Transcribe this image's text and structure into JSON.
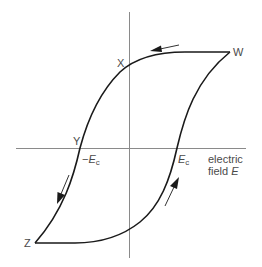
{
  "diagram": {
    "type": "ferroelectric hysteresis loop",
    "points": {
      "W": "W",
      "X": "X",
      "Y": "Y",
      "Z": "Z"
    },
    "axis_labels": {
      "x_line1": "electric",
      "x_line2": "field",
      "x_symbol": "E"
    },
    "coercive": {
      "neg_prefix": "−",
      "symbol": "E",
      "subscript": "c"
    },
    "colors": {
      "curve": "#1a1a1a",
      "axis": "#8a8a8a",
      "text": "#4a4a4a",
      "background": "#ffffff"
    }
  }
}
